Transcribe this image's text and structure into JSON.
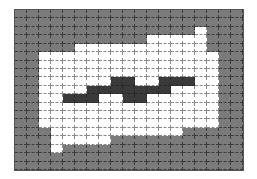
{
  "grid": {
    "cols": 19,
    "rows": 19,
    "colors": {
      "background": "#7b7b7b",
      "region": "#ffffff",
      "band": "#3a3a3a",
      "gridline": "#3d3d3d"
    },
    "legend": {
      "0": "gray background",
      "1": "white region",
      "2": "dark band"
    },
    "cells": [
      "0000000000000000000",
      "0000000000000000000",
      "0000000000000001000",
      "0000000000011111000",
      "0000011111111111000",
      "0011111111111111100",
      "0011111111111111100",
      "0011111111111111100",
      "0011111122112221100",
      "0011112222222111100",
      "0011222112211111100",
      "0011111111111111100",
      "0011111111111111100",
      "0011111111111111100",
      "0001111111111100000",
      "0001111100000000000",
      "0001000000000000000",
      "0000000000000000000",
      "0000000000000000000"
    ]
  }
}
